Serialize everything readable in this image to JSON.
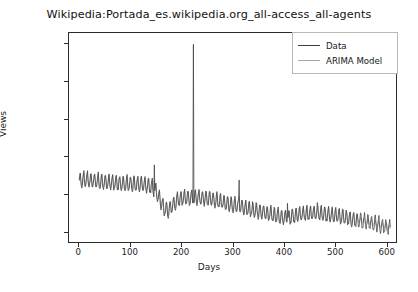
{
  "chart_data": {
    "type": "line",
    "title": "Wikipedia:Portada_es.wikipedia.org_all-access_all-agents",
    "xlabel": "Days",
    "ylabel": "Views",
    "xlim": [
      -20,
      620
    ],
    "ylim": [
      850000,
      3650000
    ],
    "xticks": [
      0,
      100,
      200,
      300,
      400,
      500,
      600
    ],
    "yticks": [
      1000000,
      1500000,
      2000000,
      2500000,
      3000000,
      3500000
    ],
    "xtick_labels": [
      "0",
      "100",
      "200",
      "300",
      "400",
      "500",
      "600"
    ],
    "ytick_labels": [
      "1000000",
      "1500000",
      "2000000",
      "2500000",
      "3000000",
      "3500000"
    ],
    "grid": false,
    "legend_position": "upper right",
    "series": [
      {
        "name": "Data",
        "color": "#3d3d3d",
        "trend_points": [
          [
            0,
            1705000
          ],
          [
            10,
            1715000
          ],
          [
            25,
            1700000
          ],
          [
            40,
            1690000
          ],
          [
            55,
            1680000
          ],
          [
            70,
            1672000
          ],
          [
            85,
            1665000
          ],
          [
            100,
            1660000
          ],
          [
            115,
            1650000
          ],
          [
            130,
            1640000
          ],
          [
            140,
            1625000
          ],
          [
            150,
            1560000
          ],
          [
            158,
            1430000
          ],
          [
            165,
            1330000
          ],
          [
            172,
            1300000
          ],
          [
            180,
            1360000
          ],
          [
            190,
            1430000
          ],
          [
            200,
            1465000
          ],
          [
            212,
            1470000
          ],
          [
            225,
            1475000
          ],
          [
            240,
            1470000
          ],
          [
            255,
            1455000
          ],
          [
            270,
            1430000
          ],
          [
            285,
            1400000
          ],
          [
            300,
            1375000
          ],
          [
            315,
            1350000
          ],
          [
            330,
            1325000
          ],
          [
            345,
            1300000
          ],
          [
            360,
            1275000
          ],
          [
            375,
            1250000
          ],
          [
            390,
            1220000
          ],
          [
            400,
            1210000
          ],
          [
            415,
            1225000
          ],
          [
            430,
            1250000
          ],
          [
            445,
            1265000
          ],
          [
            460,
            1270000
          ],
          [
            475,
            1258000
          ],
          [
            490,
            1240000
          ],
          [
            505,
            1225000
          ],
          [
            520,
            1205000
          ],
          [
            535,
            1185000
          ],
          [
            550,
            1165000
          ],
          [
            565,
            1145000
          ],
          [
            580,
            1120000
          ],
          [
            595,
            1090000
          ],
          [
            605,
            1060000
          ]
        ],
        "weekly_amplitude": 95000,
        "weekly_period": 7,
        "noise": 28000,
        "spikes": [
          {
            "day": 146,
            "value": 1900000
          },
          {
            "day": 222,
            "value": 3500000
          },
          {
            "day": 311,
            "value": 1700000
          },
          {
            "day": 405,
            "value": 1390000
          },
          {
            "day": 463,
            "value": 1400000
          }
        ]
      },
      {
        "name": "ARIMA Model",
        "color": "#a8a8a8",
        "note": "fitted / forecast overlay following the same trend, smoother tail"
      }
    ]
  },
  "legend": {
    "entries": [
      {
        "label": "Data",
        "color": "#3d3d3d"
      },
      {
        "label": "ARIMA Model",
        "color": "#a8a8a8"
      }
    ]
  }
}
